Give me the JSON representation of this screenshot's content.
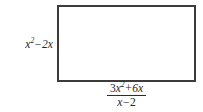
{
  "figure": {
    "kind": "labeled-rectangle-diagram",
    "shape": "rectangle",
    "labels": {
      "left_side": {
        "text": "x² − 2x",
        "coefficient": 1,
        "variable": "x",
        "exponent": "2",
        "operator": "−",
        "second_term": "2x"
      },
      "bottom_side": {
        "text": "(3x² + 6x)/(x − 2)",
        "type": "fraction",
        "numerator": {
          "text": "3x² + 6x",
          "first_coefficient": "3",
          "variable": "x",
          "exponent": "2",
          "operator": "+",
          "second_term": "6x"
        },
        "denominator": {
          "text": "x − 2",
          "variable": "x",
          "operator": "−",
          "constant": "2"
        }
      }
    },
    "colors": {
      "border": "#3c3c3c",
      "text": "#272727",
      "background": "#ffffff",
      "fraction_bar": "#2b2b2b"
    }
  }
}
